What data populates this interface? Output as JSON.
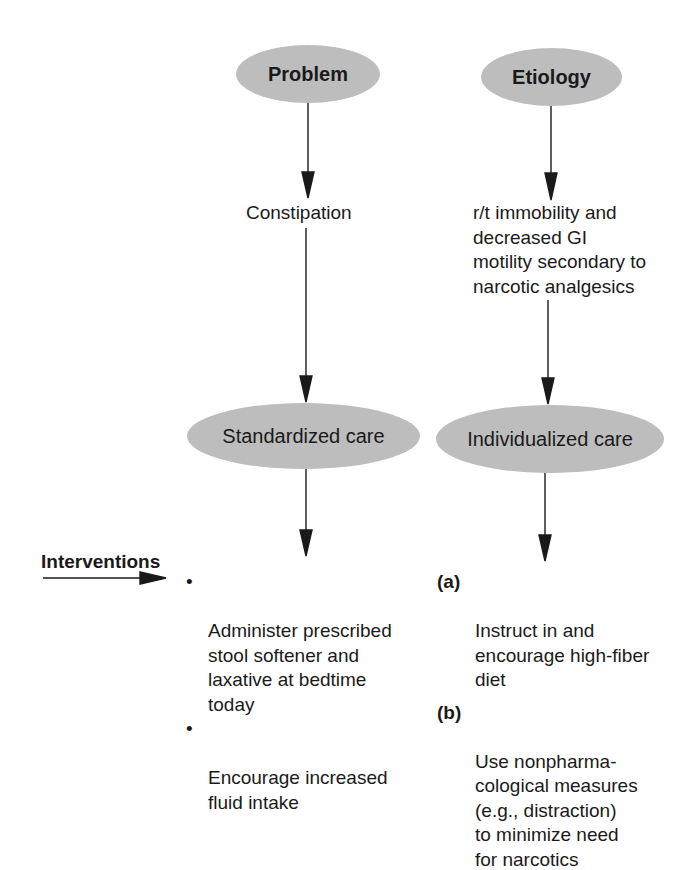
{
  "columns": {
    "left": {
      "header": "Problem",
      "statement": "Constipation",
      "care_node": "Standardized care",
      "interventions": [
        "Administer prescribed\nstool softener and\nlaxative at bedtime\ntoday",
        "Encourage increased\nfluid intake"
      ],
      "bullet": "•"
    },
    "right": {
      "header": "Etiology",
      "statement_lines": [
        "r/t immobility and",
        "decreased GI",
        "motility secondary to",
        "narcotic analgesics"
      ],
      "care_node": "Individualized care",
      "interventions": [
        {
          "marker": "(a)",
          "text": "Instruct in and\nencourage high-fiber\ndiet"
        },
        {
          "marker": "(b)",
          "text": "Use nonpharma-\ncological measures\n(e.g., distraction)\nto minimize need\nfor narcotics"
        }
      ]
    }
  },
  "interventions_label": "Interventions",
  "colors": {
    "ellipse_fill": "#bdbdbd",
    "line": "#1a1a1a",
    "background": "#ffffff"
  }
}
